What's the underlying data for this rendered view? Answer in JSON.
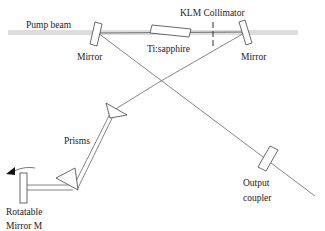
{
  "labels": {
    "pump_beam": "Pump beam",
    "mirror_left": "Mirror",
    "mirror_right": "Mirror",
    "crystal": "Ti:sapphire",
    "klm": "KLM Collimator",
    "prisms": "Prisms",
    "output_line1": "Output",
    "output_line2": "coupler",
    "rotatable_line1": "Rotatable",
    "rotatable_line2": "Mirror M"
  },
  "colors": {
    "pump": "#d9d9d9",
    "line": "#555555",
    "outline": "#444444"
  }
}
